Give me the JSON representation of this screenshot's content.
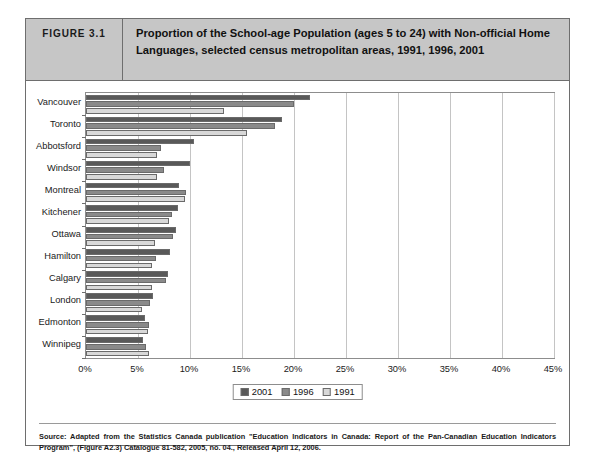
{
  "figure": {
    "number_label": "FIGURE 3.1",
    "title": "Proportion of the School-age Population (ages 5 to 24) with Non-official Home Languages, selected census metropolitan areas, 1991, 1996, 2001",
    "source_note": "Source: Adapted from the Statistics Canada publication \"Education Indicators in Canada: Report of the Pan-Canadian Education Indicators Program\", (Figure A2.3) Catalogue 81-582, 2005, no. 04., Released April 12, 2006."
  },
  "chart_data": {
    "type": "bar",
    "orientation": "horizontal",
    "title": "Proportion of the School-age Population (ages 5 to 24) with Non-official Home Languages, selected census metropolitan areas, 1991, 1996, 2001",
    "xlabel": "",
    "ylabel": "",
    "xlim": [
      0,
      45
    ],
    "xticks": [
      "0%",
      "5%",
      "10%",
      "15%",
      "20%",
      "25%",
      "30%",
      "35%",
      "40%",
      "45%"
    ],
    "xtick_values": [
      0,
      5,
      10,
      15,
      20,
      25,
      30,
      35,
      40,
      45
    ],
    "grid": true,
    "legend_position": "bottom-center",
    "categories": [
      "Vancouver",
      "Toronto",
      "Abbotsford",
      "Windsor",
      "Montreal",
      "Kitchener",
      "Ottawa",
      "Hamilton",
      "Calgary",
      "London",
      "Edmonton",
      "Winnipeg"
    ],
    "series": [
      {
        "name": "2001",
        "color": "#595959",
        "values": [
          21.5,
          18.8,
          10.4,
          10.0,
          8.9,
          8.8,
          8.7,
          8.1,
          7.9,
          6.4,
          5.7,
          5.5
        ]
      },
      {
        "name": "1996",
        "color": "#8a8a8a",
        "values": [
          20.0,
          18.2,
          7.2,
          7.5,
          9.6,
          8.3,
          8.4,
          6.7,
          7.7,
          6.2,
          6.1,
          5.8
        ]
      },
      {
        "name": "1991",
        "color": "#d8d8d8",
        "values": [
          13.3,
          15.5,
          6.8,
          6.8,
          9.5,
          8.0,
          6.6,
          6.3,
          6.3,
          5.4,
          6.0,
          6.1
        ]
      }
    ]
  },
  "legend": {
    "items": [
      {
        "label": "2001"
      },
      {
        "label": "1996"
      },
      {
        "label": "1991"
      }
    ]
  }
}
